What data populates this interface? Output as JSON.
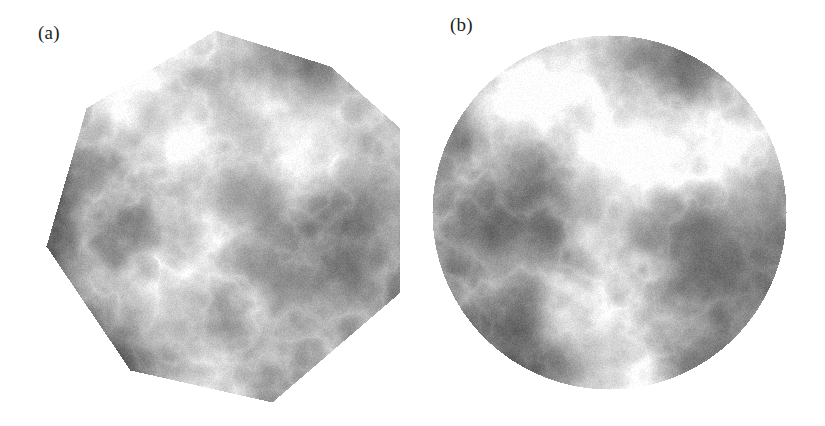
{
  "figure": {
    "background_color": "#ffffff",
    "width": 825,
    "height": 426,
    "panel_count": 2
  },
  "panels": [
    {
      "id": "a",
      "label": "(a)",
      "label_x": 38,
      "label_y": 22,
      "clip_shape": "polygon",
      "description": "Grayscale fractal terrain field clipped to an irregular convex heptagon",
      "polygon_vertices": [
        [
          215,
          30
        ],
        [
          330,
          66
        ],
        [
          400,
          128
        ],
        [
          400,
          292
        ],
        [
          272,
          402
        ],
        [
          130,
          370
        ],
        [
          46,
          246
        ],
        [
          86,
          108
        ]
      ]
    },
    {
      "id": "b",
      "label": "(b)",
      "label_x": 450,
      "label_y": 14,
      "clip_shape": "circle",
      "description": "Grayscale fractal terrain field clipped to a circular disc",
      "circle": {
        "cx": 609,
        "cy": 212,
        "r": 177
      }
    }
  ],
  "chart_data": {
    "type": "heatmap",
    "title": "",
    "subtitle": "",
    "xlabel": "",
    "ylabel": "",
    "grid": false,
    "legend": null,
    "colormap": "grayscale",
    "value_range": [
      0,
      1
    ],
    "colors": {
      "low": "#0d0d0d",
      "mid": "#808080",
      "high": "#ffffff",
      "background": "#ffffff",
      "label_text": "#231f20"
    },
    "annotations": [
      "(a)",
      "(b)"
    ],
    "panels": [
      {
        "name": "(a)",
        "mask": "polygon",
        "field_nodes": [
          {
            "x": 0.12,
            "y": 0.1,
            "v": 0.3
          },
          {
            "x": 0.34,
            "y": 0.08,
            "v": 0.62
          },
          {
            "x": 0.3,
            "y": 0.2,
            "v": 0.88
          },
          {
            "x": 0.5,
            "y": 0.14,
            "v": 0.45
          },
          {
            "x": 0.72,
            "y": 0.12,
            "v": 0.36
          },
          {
            "x": 0.88,
            "y": 0.22,
            "v": 0.52
          },
          {
            "x": 0.06,
            "y": 0.34,
            "v": 0.18
          },
          {
            "x": 0.22,
            "y": 0.4,
            "v": 0.28
          },
          {
            "x": 0.47,
            "y": 0.33,
            "v": 0.95
          },
          {
            "x": 0.6,
            "y": 0.3,
            "v": 0.82
          },
          {
            "x": 0.74,
            "y": 0.33,
            "v": 0.97
          },
          {
            "x": 0.9,
            "y": 0.4,
            "v": 0.48
          },
          {
            "x": 0.1,
            "y": 0.52,
            "v": 0.12
          },
          {
            "x": 0.28,
            "y": 0.55,
            "v": 0.22
          },
          {
            "x": 0.44,
            "y": 0.5,
            "v": 0.72
          },
          {
            "x": 0.62,
            "y": 0.48,
            "v": 0.6
          },
          {
            "x": 0.8,
            "y": 0.55,
            "v": 0.3
          },
          {
            "x": 0.16,
            "y": 0.7,
            "v": 0.24
          },
          {
            "x": 0.38,
            "y": 0.72,
            "v": 0.78
          },
          {
            "x": 0.56,
            "y": 0.68,
            "v": 0.4
          },
          {
            "x": 0.74,
            "y": 0.74,
            "v": 0.33
          },
          {
            "x": 0.26,
            "y": 0.88,
            "v": 0.2
          },
          {
            "x": 0.48,
            "y": 0.9,
            "v": 0.66
          },
          {
            "x": 0.7,
            "y": 0.88,
            "v": 0.26
          }
        ]
      },
      {
        "name": "(b)",
        "mask": "circle",
        "field_nodes": [
          {
            "x": 0.18,
            "y": 0.1,
            "v": 0.34
          },
          {
            "x": 0.36,
            "y": 0.14,
            "v": 0.8
          },
          {
            "x": 0.3,
            "y": 0.22,
            "v": 0.9
          },
          {
            "x": 0.52,
            "y": 0.1,
            "v": 0.4
          },
          {
            "x": 0.72,
            "y": 0.14,
            "v": 0.3
          },
          {
            "x": 0.88,
            "y": 0.26,
            "v": 0.56
          },
          {
            "x": 0.08,
            "y": 0.36,
            "v": 0.16
          },
          {
            "x": 0.24,
            "y": 0.42,
            "v": 0.3
          },
          {
            "x": 0.5,
            "y": 0.38,
            "v": 0.96
          },
          {
            "x": 0.66,
            "y": 0.34,
            "v": 0.86
          },
          {
            "x": 0.8,
            "y": 0.4,
            "v": 0.7
          },
          {
            "x": 0.94,
            "y": 0.46,
            "v": 0.38
          },
          {
            "x": 0.12,
            "y": 0.56,
            "v": 0.1
          },
          {
            "x": 0.3,
            "y": 0.58,
            "v": 0.26
          },
          {
            "x": 0.46,
            "y": 0.54,
            "v": 0.74
          },
          {
            "x": 0.64,
            "y": 0.56,
            "v": 0.44
          },
          {
            "x": 0.84,
            "y": 0.62,
            "v": 0.28
          },
          {
            "x": 0.18,
            "y": 0.74,
            "v": 0.22
          },
          {
            "x": 0.4,
            "y": 0.76,
            "v": 0.82
          },
          {
            "x": 0.58,
            "y": 0.72,
            "v": 0.36
          },
          {
            "x": 0.78,
            "y": 0.8,
            "v": 0.3
          },
          {
            "x": 0.3,
            "y": 0.9,
            "v": 0.24
          },
          {
            "x": 0.5,
            "y": 0.92,
            "v": 0.62
          },
          {
            "x": 0.72,
            "y": 0.9,
            "v": 0.28
          }
        ]
      }
    ]
  }
}
